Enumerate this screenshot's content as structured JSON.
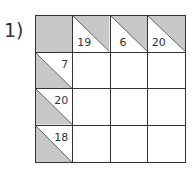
{
  "puzzle": {
    "label": "1)",
    "type": "kakuro",
    "size": 4,
    "colors": {
      "shade": "#c8c8c8",
      "line": "#333333"
    },
    "column_clues": [
      {
        "col": 1,
        "sum": "19"
      },
      {
        "col": 2,
        "sum": "6"
      },
      {
        "col": 3,
        "sum": "20"
      }
    ],
    "row_clues": [
      {
        "row": 1,
        "sum": "7"
      },
      {
        "row": 2,
        "sum": "20"
      },
      {
        "row": 3,
        "sum": "18"
      }
    ],
    "entries": [
      [
        "",
        "",
        ""
      ],
      [
        "",
        "",
        ""
      ],
      [
        "",
        "",
        ""
      ]
    ]
  }
}
